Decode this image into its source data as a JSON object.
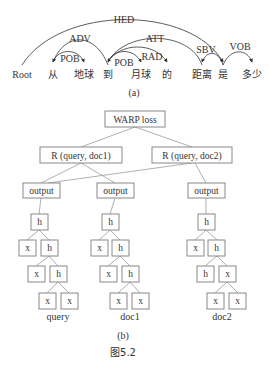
{
  "figure_caption": "图5.2",
  "part_a": {
    "caption": "(a)",
    "words": [
      {
        "text": "Root",
        "x": 22
      },
      {
        "text": "从",
        "x": 53
      },
      {
        "text": "地球",
        "x": 84
      },
      {
        "text": "到",
        "x": 108
      },
      {
        "text": "月球",
        "x": 141
      },
      {
        "text": "的",
        "x": 167
      },
      {
        "text": "距离",
        "x": 202
      },
      {
        "text": "是",
        "x": 223
      },
      {
        "text": "多少",
        "x": 252
      }
    ],
    "arcs": [
      {
        "label": "HED",
        "from": 0,
        "to": 7
      },
      {
        "label": "ADV",
        "from": 3,
        "to": 1
      },
      {
        "label": "POB",
        "from": 1,
        "to": 2
      },
      {
        "label": "ATT",
        "from": 6,
        "to": 3
      },
      {
        "label": "POB",
        "from": 3,
        "to": 4
      },
      {
        "label": "RAD",
        "from": 3,
        "to": 5
      },
      {
        "label": "SBV",
        "from": 7,
        "to": 6
      },
      {
        "label": "VOB",
        "from": 7,
        "to": 8
      }
    ]
  },
  "part_b": {
    "caption": "(b)",
    "loss_node": "WARP loss",
    "rank_nodes": [
      "R (query, doc1)",
      "R (query, doc2)"
    ],
    "output_label": "output",
    "trees": [
      {
        "name": "query",
        "levels": [
          [
            "h"
          ],
          [
            "x",
            "h"
          ],
          [
            "x",
            "h"
          ],
          [
            "x",
            "x"
          ]
        ]
      },
      {
        "name": "doc1",
        "levels": [
          [
            "h"
          ],
          [
            "x",
            "h"
          ],
          [
            "x",
            "h"
          ],
          [
            "x",
            "x"
          ]
        ]
      },
      {
        "name": "doc2",
        "levels": [
          [
            "h"
          ],
          [
            "x",
            "h"
          ],
          [
            "h",
            "x"
          ],
          [
            "x",
            "x"
          ]
        ]
      }
    ]
  },
  "colors": {
    "text": "#333333",
    "box_border": "#888888",
    "edge": "#9a9a9a"
  }
}
